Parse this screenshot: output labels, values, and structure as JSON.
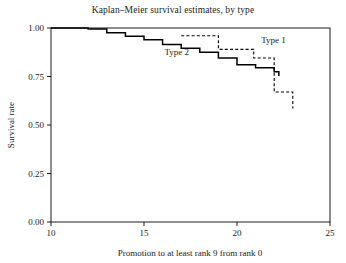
{
  "chart_data": {
    "type": "line",
    "subtype": "kaplan-meier-step",
    "title": "Kaplan–Meier survival estimates, by type",
    "xlabel": "Promotion to at least rank 9 from rank 0",
    "ylabel": "Survival rate",
    "xlim": [
      10,
      25
    ],
    "ylim": [
      0.0,
      1.0
    ],
    "xticks": [
      10,
      15,
      20,
      25
    ],
    "xtick_labels": [
      "10",
      "15",
      "20",
      "25"
    ],
    "yticks": [
      0.0,
      0.25,
      0.5,
      0.75,
      1.0
    ],
    "ytick_labels": [
      "0.00",
      "0.25",
      "0.50",
      "0.75",
      "1.00"
    ],
    "grid": false,
    "legend_position": "inline-annotations",
    "series": [
      {
        "name": "Type 1",
        "style": "dashed",
        "color": "#000000",
        "annotation": "Type 1",
        "annotation_x": 21.3,
        "annotation_y": 0.925,
        "x": [
          17.0,
          19.0,
          19.0,
          20.9,
          20.9,
          22.0,
          22.0,
          23.0,
          23.0
        ],
        "y": [
          0.96,
          0.96,
          0.89,
          0.89,
          0.845,
          0.845,
          0.67,
          0.67,
          0.585
        ]
      },
      {
        "name": "Type 2",
        "style": "solid",
        "color": "#000000",
        "annotation": "Type 2",
        "annotation_x": 16.1,
        "annotation_y": 0.862,
        "x": [
          10.0,
          12.0,
          13.0,
          14.0,
          15.0,
          16.0,
          17.0,
          18.0,
          19.0,
          20.0,
          21.0,
          22.0,
          22.25
        ],
        "y": [
          1.0,
          0.995,
          0.975,
          0.957,
          0.94,
          0.915,
          0.895,
          0.875,
          0.845,
          0.81,
          0.795,
          0.775,
          0.752
        ],
        "steps": [
          {
            "x": 10.0,
            "y": 1.0
          },
          {
            "x": 12.0,
            "y": 0.995
          },
          {
            "x": 13.0,
            "y": 0.975
          },
          {
            "x": 14.0,
            "y": 0.957
          },
          {
            "x": 15.0,
            "y": 0.94
          },
          {
            "x": 16.0,
            "y": 0.915
          },
          {
            "x": 17.0,
            "y": 0.895
          },
          {
            "x": 18.0,
            "y": 0.875
          },
          {
            "x": 19.0,
            "y": 0.845
          },
          {
            "x": 20.0,
            "y": 0.81
          },
          {
            "x": 21.0,
            "y": 0.795
          },
          {
            "x": 22.0,
            "y": 0.775
          },
          {
            "x": 22.25,
            "y": 0.752
          }
        ]
      }
    ]
  }
}
